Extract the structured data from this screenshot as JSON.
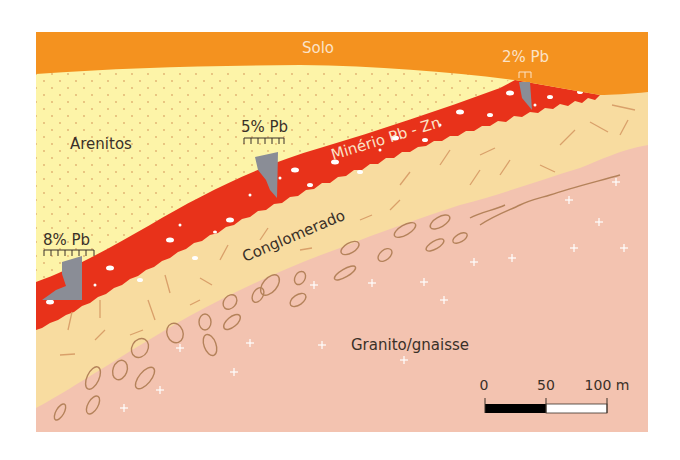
{
  "diagram": {
    "type": "geological-cross-section",
    "layers": [
      {
        "id": "solo",
        "label": "Solo",
        "color": "#f4921f"
      },
      {
        "id": "arenitos",
        "label": "Arenitos",
        "color": "#fdf4a8"
      },
      {
        "id": "minerio",
        "label": "Minério Pb - Zn",
        "color": "#e8321a"
      },
      {
        "id": "conglomerado",
        "label": "Conglomerado",
        "color": "#f8dca0"
      },
      {
        "id": "granito",
        "label": "Granito/gnaisse",
        "color": "#f3c3b0"
      }
    ],
    "samples": [
      {
        "label": "8% Pb",
        "x": 62
      },
      {
        "label": "5% Pb",
        "x": 262
      },
      {
        "label": "2% Pb",
        "x": 527
      }
    ],
    "scale_bar": {
      "ticks": [
        "0",
        "50",
        "100 m"
      ],
      "segments": [
        "#000000",
        "#ffffff"
      ]
    },
    "colors": {
      "outcrop": "#8a8d96",
      "pebble_outline": "#b4825a",
      "dash": "#d9a06a"
    }
  }
}
